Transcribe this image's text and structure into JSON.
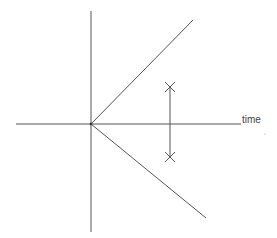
{
  "diagram": {
    "type": "spacetime-light-cone",
    "colors": {
      "background": "#ffffff",
      "line": "#555555",
      "text": "#444444"
    },
    "origin": {
      "x": 91,
      "y": 124
    },
    "axes": {
      "horizontal": {
        "x1": 16,
        "y1": 124,
        "x2": 241,
        "y2": 124,
        "label": "time"
      },
      "vertical": {
        "x1": 91,
        "y1": 11,
        "x2": 91,
        "y2": 232
      }
    },
    "cone_lines": {
      "upper": {
        "x1": 91,
        "y1": 124,
        "x2": 193,
        "y2": 20
      },
      "lower": {
        "x1": 91,
        "y1": 124,
        "x2": 206,
        "y2": 218
      }
    },
    "event_segment": {
      "x1": 170,
      "y1": 87,
      "x2": 170,
      "y2": 157,
      "markers": [
        {
          "name": "upper-event",
          "x": 170,
          "y": 87
        },
        {
          "name": "lower-event",
          "x": 170,
          "y": 157
        }
      ]
    },
    "labels": {
      "time": "time"
    }
  }
}
